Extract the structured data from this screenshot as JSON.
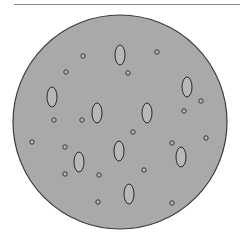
{
  "figure": {
    "colors": {
      "background": "#ffffff",
      "dish_fill": "#a9a9a9",
      "dish_stroke": "#3a3a3a",
      "particle_fill": "#b8b8b8",
      "particle_stroke": "#2a2a2a",
      "top_rule": "#8a8a8a"
    },
    "dish": {
      "cx": 120,
      "cy": 122,
      "r": 107
    },
    "large_ovals": [
      {
        "cx": 120,
        "cy": 55,
        "rx": 5,
        "ry": 10
      },
      {
        "cx": 52,
        "cy": 97,
        "rx": 5,
        "ry": 10
      },
      {
        "cx": 97,
        "cy": 113,
        "rx": 5,
        "ry": 10
      },
      {
        "cx": 147,
        "cy": 113,
        "rx": 5,
        "ry": 10
      },
      {
        "cx": 187,
        "cy": 87,
        "rx": 5,
        "ry": 10
      },
      {
        "cx": 119,
        "cy": 151,
        "rx": 5,
        "ry": 10
      },
      {
        "cx": 79,
        "cy": 162,
        "rx": 5,
        "ry": 10
      },
      {
        "cx": 181,
        "cy": 157,
        "rx": 5,
        "ry": 10
      },
      {
        "cx": 129,
        "cy": 194,
        "rx": 5,
        "ry": 10
      }
    ],
    "small_circles": [
      {
        "cx": 83,
        "cy": 56
      },
      {
        "cx": 66,
        "cy": 72
      },
      {
        "cx": 157,
        "cy": 52
      },
      {
        "cx": 128,
        "cy": 73
      },
      {
        "cx": 54,
        "cy": 120
      },
      {
        "cx": 82,
        "cy": 120
      },
      {
        "cx": 201,
        "cy": 101
      },
      {
        "cx": 184,
        "cy": 111
      },
      {
        "cx": 133,
        "cy": 132
      },
      {
        "cx": 32,
        "cy": 142
      },
      {
        "cx": 65,
        "cy": 147
      },
      {
        "cx": 172,
        "cy": 143
      },
      {
        "cx": 206,
        "cy": 138
      },
      {
        "cx": 65,
        "cy": 174
      },
      {
        "cx": 99,
        "cy": 175
      },
      {
        "cx": 144,
        "cy": 170
      },
      {
        "cx": 98,
        "cy": 202
      },
      {
        "cx": 172,
        "cy": 203
      }
    ],
    "small_circle_r": 2.2
  }
}
